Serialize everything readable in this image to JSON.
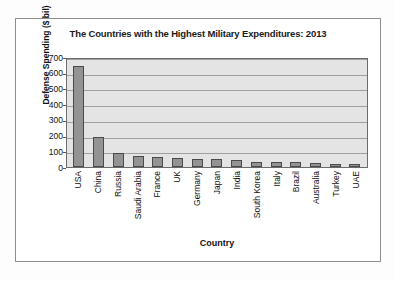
{
  "chart_data": {
    "type": "bar",
    "title": "The Countries with the Highest Military Expenditures: 2013",
    "xlabel": "Country",
    "ylabel": "Defense Spending ($ bil)",
    "ylim": [
      0,
      700
    ],
    "ytick_step": 100,
    "yticks": [
      "700",
      "600",
      "500",
      "400",
      "300",
      "200",
      "100",
      "0"
    ],
    "grid": true,
    "legend": "none",
    "categories": [
      "USA",
      "China",
      "Russia",
      "Saudi Arabia",
      "France",
      "UK",
      "Germany",
      "Japan",
      "India",
      "South Korea",
      "Italy",
      "Brazil",
      "Australia",
      "Turkey",
      "UAE"
    ],
    "values": [
      640,
      188,
      88,
      67,
      61,
      58,
      49,
      49,
      47,
      34,
      33,
      31,
      24,
      19,
      19
    ],
    "bar_color": "#939393",
    "bar_edge_color": "#4a4a4a",
    "plot_background": "#e4e4e4",
    "gridline_color": "#a0a0a0"
  }
}
